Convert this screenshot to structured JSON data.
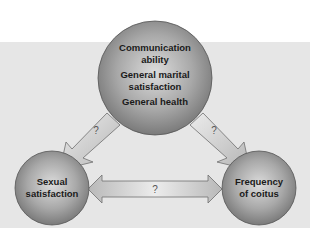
{
  "diagram": {
    "top_node": {
      "lines": [
        "Communication",
        "ability",
        "General marital",
        "satisfaction",
        "General health"
      ]
    },
    "left_node": {
      "lines": [
        "Sexual",
        "satisfaction"
      ]
    },
    "right_node": {
      "lines": [
        "Frequency",
        "of coitus"
      ]
    },
    "edges": {
      "top_to_left": {
        "label": "?"
      },
      "top_to_right": {
        "label": "?"
      },
      "left_right": {
        "label": "?"
      }
    },
    "colors": {
      "panel": "#e6e6e6",
      "node_light": "#d9d9d9",
      "node_dark": "#7a7a7a",
      "arrow_fill": "#d4d4d4",
      "arrow_stroke": "#6e6e6e"
    }
  }
}
